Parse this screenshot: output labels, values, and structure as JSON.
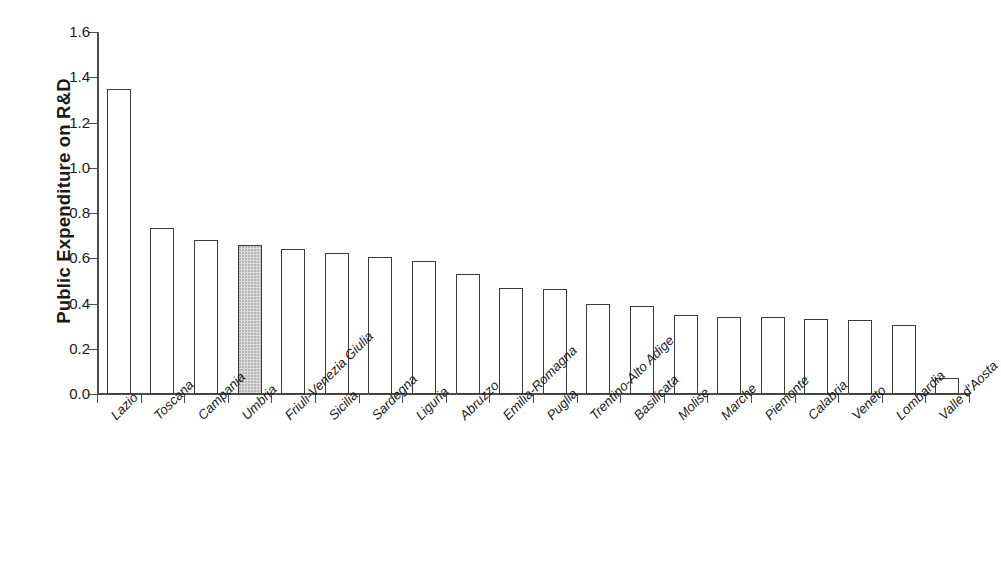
{
  "chart_data": {
    "type": "bar",
    "title": "",
    "xlabel": "",
    "ylabel": "Public Expenditure on R&D",
    "ylim": [
      0.0,
      1.6
    ],
    "ytick_labels": [
      "0.0",
      "0.2",
      "0.4",
      "0.6",
      "0.8",
      "1.0",
      "1.2",
      "1.4",
      "1.6"
    ],
    "ytick_values": [
      0.0,
      0.2,
      0.4,
      0.6,
      0.8,
      1.0,
      1.2,
      1.4,
      1.6
    ],
    "grid": false,
    "legend": "none",
    "highlight_category": "Umbria",
    "categories": [
      "Lazio",
      "Toscana",
      "Campania",
      "Umbria",
      "Friuli-Venezia Giulia",
      "Sicilia",
      "Sardegna",
      "Liguria",
      "Abruzzo",
      "Emilia-Romagna",
      "Puglia",
      "Trentino-Alto Adige",
      "Basilicata",
      "Molise",
      "Marche",
      "Piemonte",
      "Calabria",
      "Veneto",
      "Lombardia",
      "Valle d'Aosta"
    ],
    "values": [
      1.35,
      0.735,
      0.68,
      0.66,
      0.64,
      0.625,
      0.605,
      0.59,
      0.53,
      0.47,
      0.465,
      0.4,
      0.39,
      0.35,
      0.34,
      0.34,
      0.33,
      0.325,
      0.305,
      0.07
    ]
  },
  "colors": {
    "axis": "#4d4d4d",
    "bar_outline": "#3b3b3b",
    "bar_fill": "#ffffff",
    "highlight_fill": "#dcdcdc",
    "text": "#1a1a1a",
    "background": "#ffffff"
  }
}
